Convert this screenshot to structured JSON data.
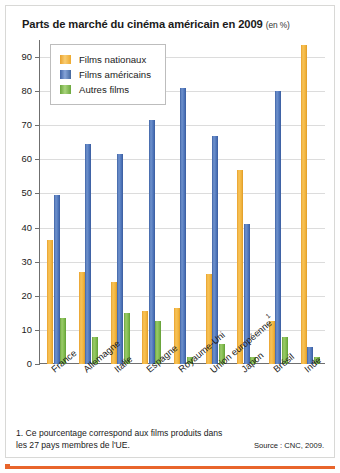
{
  "title": {
    "main": "Parts de marché du cinéma américain en 2009",
    "unit": "(en %)"
  },
  "legend": {
    "items": [
      {
        "label": "Films nationaux",
        "key": "nat",
        "color": "#F2B33D"
      },
      {
        "label": "Films américains",
        "key": "usa",
        "color": "#4A72B8"
      },
      {
        "label": "Autres films",
        "key": "oth",
        "color": "#7DB84A"
      }
    ]
  },
  "footnote": "1. Ce pourcentage correspond aux films produits dans les 27 pays membres de l'UE.",
  "source": "Source : CNC, 2009.",
  "chart_data": {
    "type": "bar",
    "title": "Parts de marché du cinéma américain en 2009 (en %)",
    "xlabel": "",
    "ylabel": "",
    "ylim": [
      0,
      95
    ],
    "yticks": [
      0,
      10,
      20,
      30,
      40,
      50,
      60,
      70,
      80,
      90
    ],
    "grid": true,
    "legend_position": "top-left",
    "categories": [
      "France",
      "Allemagne",
      "Italie",
      "Espagne",
      "Royaume-Uni",
      "Union européenne",
      "Japon",
      "Brésil",
      "Inde"
    ],
    "category_footnotes": {
      "Union européenne": "1"
    },
    "series": [
      {
        "name": "Films nationaux",
        "color": "#F2B33D",
        "values": [
          36.5,
          27,
          24,
          15.5,
          16.5,
          26.5,
          57,
          12.5,
          93.5
        ]
      },
      {
        "name": "Films américains",
        "color": "#4A72B8",
        "values": [
          49.5,
          64.5,
          61.5,
          71.5,
          81,
          67,
          41,
          80,
          5
        ]
      },
      {
        "name": "Autres films",
        "color": "#7DB84A",
        "values": [
          13.5,
          8,
          15,
          12.5,
          2,
          6,
          2,
          8,
          2
        ]
      }
    ]
  }
}
